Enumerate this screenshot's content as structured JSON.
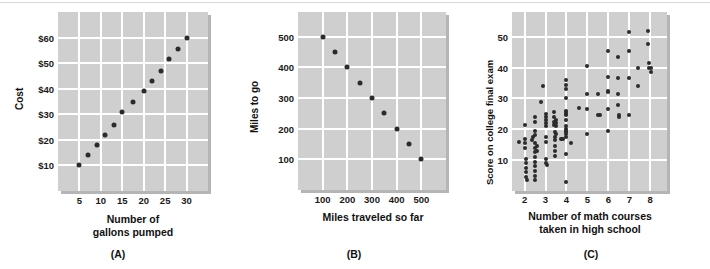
{
  "figure": {
    "background_color": "#ffffff",
    "panel_color": "#cfcfcf",
    "gridline_color": "#ffffff",
    "dot_color": "#2b2b2b"
  },
  "charts": [
    {
      "id": "A",
      "caption": "(A)",
      "chart_data": {
        "type": "scatter",
        "title": "",
        "xlabel_lines": [
          "Number of",
          "gallons pumped"
        ],
        "xlabel": "Number of gallons pumped",
        "ylabel": "Cost",
        "xlim": [
          0,
          35
        ],
        "ylim": [
          0,
          70
        ],
        "xticks": [
          5,
          10,
          15,
          20,
          25,
          30
        ],
        "xtick_labels": [
          "5",
          "10",
          "15",
          "20",
          "25",
          "30"
        ],
        "yticks": [
          10,
          20,
          30,
          40,
          50,
          60
        ],
        "ytick_labels": [
          "$10",
          "$20",
          "$30",
          "$40",
          "$50",
          "$60"
        ],
        "grid": true,
        "legend": false,
        "points": [
          [
            5,
            10
          ],
          [
            7,
            14
          ],
          [
            9,
            18
          ],
          [
            11,
            22
          ],
          [
            13,
            26
          ],
          [
            15,
            31
          ],
          [
            17.5,
            35
          ],
          [
            20,
            39
          ],
          [
            22,
            43
          ],
          [
            24,
            47
          ],
          [
            26,
            51.5
          ],
          [
            28,
            55.5
          ],
          [
            30,
            60
          ]
        ]
      }
    },
    {
      "id": "B",
      "caption": "(B)",
      "chart_data": {
        "type": "scatter",
        "title": "",
        "xlabel_lines": [
          "Miles traveled so far"
        ],
        "xlabel": "Miles traveled so far",
        "ylabel": "Miles to go",
        "xlim": [
          0,
          600
        ],
        "ylim": [
          0,
          580
        ],
        "xticks": [
          100,
          200,
          300,
          400,
          500
        ],
        "xtick_labels": [
          "100",
          "200",
          "300",
          "400",
          "500"
        ],
        "yticks": [
          100,
          200,
          300,
          400,
          500
        ],
        "ytick_labels": [
          "100",
          "200",
          "300",
          "400",
          "500"
        ],
        "grid": true,
        "legend": false,
        "points": [
          [
            100,
            500
          ],
          [
            150,
            450
          ],
          [
            200,
            400
          ],
          [
            250,
            350
          ],
          [
            300,
            300
          ],
          [
            350,
            250
          ],
          [
            400,
            200
          ],
          [
            450,
            150
          ],
          [
            500,
            100
          ]
        ]
      }
    },
    {
      "id": "C",
      "caption": "(C)",
      "chart_data": {
        "type": "scatter",
        "title": "",
        "xlabel_lines": [
          "Number of math courses",
          "taken in high school"
        ],
        "xlabel": "Number of math courses taken in high school",
        "ylabel": "Score on college final exam",
        "xlim": [
          1.4,
          8.8
        ],
        "ylim": [
          0,
          58
        ],
        "xticks": [
          2,
          3,
          4,
          5,
          6,
          7,
          8
        ],
        "xtick_labels": [
          "2",
          "3",
          "4",
          "5",
          "6",
          "7",
          "8"
        ],
        "yticks": [
          10,
          20,
          30,
          40,
          50
        ],
        "ytick_labels": [
          "10",
          "20",
          "30",
          "40",
          "50"
        ],
        "grid": true,
        "legend": false,
        "points": [
          [
            1.75,
            16
          ],
          [
            2.0,
            21.5
          ],
          [
            2.0,
            17
          ],
          [
            2.0,
            15.5
          ],
          [
            2.0,
            14
          ],
          [
            2.05,
            10.5
          ],
          [
            2.05,
            9
          ],
          [
            2.05,
            7.5
          ],
          [
            2.05,
            6
          ],
          [
            2.05,
            4.5
          ],
          [
            2.1,
            3.5
          ],
          [
            2.35,
            16.5
          ],
          [
            2.4,
            17.5
          ],
          [
            2.5,
            24
          ],
          [
            2.5,
            22.5
          ],
          [
            2.5,
            19.5
          ],
          [
            2.5,
            18
          ],
          [
            2.5,
            15.5
          ],
          [
            2.5,
            14
          ],
          [
            2.5,
            12.5
          ],
          [
            2.5,
            11
          ],
          [
            2.5,
            9.5
          ],
          [
            2.5,
            8
          ],
          [
            2.5,
            6.5
          ],
          [
            2.5,
            5
          ],
          [
            2.5,
            3.5
          ],
          [
            2.6,
            14.5
          ],
          [
            2.6,
            13
          ],
          [
            2.8,
            29
          ],
          [
            2.9,
            34
          ],
          [
            3.0,
            25
          ],
          [
            3.0,
            24
          ],
          [
            3.0,
            23
          ],
          [
            3.0,
            22
          ],
          [
            3.0,
            21
          ],
          [
            3.0,
            17.5
          ],
          [
            3.0,
            16
          ],
          [
            3.0,
            10.5
          ],
          [
            3.0,
            9
          ],
          [
            3.05,
            8.5
          ],
          [
            3.4,
            25.5
          ],
          [
            3.4,
            24
          ],
          [
            3.4,
            22.5
          ],
          [
            3.4,
            21.5
          ],
          [
            3.45,
            19
          ],
          [
            3.45,
            17.5
          ],
          [
            3.45,
            16.5
          ],
          [
            3.45,
            14.5
          ],
          [
            3.45,
            13
          ],
          [
            3.45,
            11.5
          ],
          [
            3.5,
            23
          ],
          [
            3.5,
            22
          ],
          [
            3.5,
            21
          ],
          [
            3.5,
            18.5
          ],
          [
            3.75,
            17
          ],
          [
            3.8,
            17
          ],
          [
            3.85,
            17
          ],
          [
            4.0,
            36
          ],
          [
            4.0,
            34.5
          ],
          [
            4.0,
            33
          ],
          [
            4.0,
            30
          ],
          [
            4.0,
            26
          ],
          [
            4.0,
            25.5
          ],
          [
            4.0,
            25
          ],
          [
            4.0,
            24.5
          ],
          [
            4.0,
            23
          ],
          [
            4.0,
            21
          ],
          [
            4.0,
            20
          ],
          [
            4.0,
            19.5
          ],
          [
            4.0,
            19
          ],
          [
            4.0,
            18.5
          ],
          [
            4.0,
            17.5
          ],
          [
            4.0,
            12
          ],
          [
            4.0,
            3
          ],
          [
            4.2,
            15.5
          ],
          [
            4.6,
            27
          ],
          [
            5.0,
            40.5
          ],
          [
            5.0,
            31.5
          ],
          [
            5.0,
            26.5
          ],
          [
            5.0,
            18.5
          ],
          [
            5.5,
            31.5
          ],
          [
            5.5,
            24.5
          ],
          [
            5.6,
            24.5
          ],
          [
            6.0,
            45.5
          ],
          [
            6.0,
            37
          ],
          [
            6.0,
            32.5
          ],
          [
            6.0,
            32
          ],
          [
            6.0,
            26.5
          ],
          [
            6.0,
            19.5
          ],
          [
            6.45,
            43.5
          ],
          [
            6.45,
            36.5
          ],
          [
            6.45,
            31.5
          ],
          [
            6.45,
            28
          ],
          [
            6.5,
            24.5
          ],
          [
            6.5,
            24
          ],
          [
            7.0,
            51.5
          ],
          [
            7.0,
            45.5
          ],
          [
            7.0,
            36.5
          ],
          [
            7.0,
            24.5
          ],
          [
            7.4,
            40
          ],
          [
            7.4,
            34
          ],
          [
            7.9,
            52
          ],
          [
            7.9,
            47.5
          ],
          [
            7.95,
            41.5
          ],
          [
            7.95,
            40
          ],
          [
            8.05,
            40
          ],
          [
            8.05,
            38.5
          ]
        ]
      }
    }
  ]
}
